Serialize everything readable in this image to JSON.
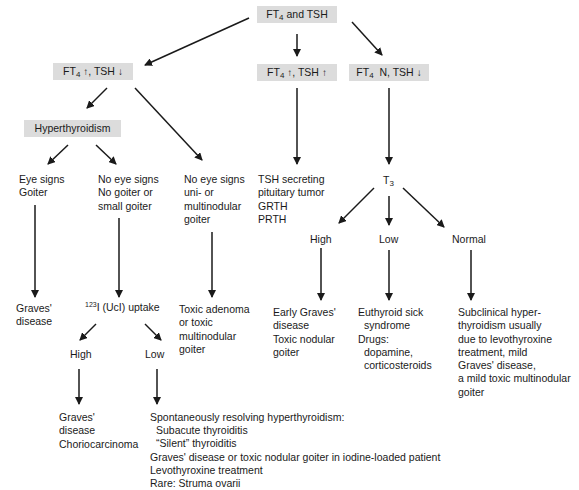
{
  "diagram": {
    "type": "flowchart",
    "nodes": {
      "root": {
        "label_pre": "FT",
        "label_sub": "4",
        "label_post": " and TSH"
      },
      "ft4_up_tsh_down": {
        "label_pre": "FT",
        "label_sub": "4",
        "ft4_arrow": "↑",
        "label_mid": ", TSH ",
        "tsh_arrow": "↓"
      },
      "ft4_up_tsh_up": {
        "label_pre": "FT",
        "label_sub": "4",
        "ft4_arrow": "↑",
        "label_mid": ", TSH  ",
        "tsh_arrow": "↑"
      },
      "ft4_n_tsh_down": {
        "label_pre": "FT",
        "label_sub": "4",
        "label_mid": "  N, TSH ",
        "tsh_arrow": "↓"
      },
      "hyperthyroidism": {
        "label": "Hyperthyroidism"
      },
      "eye_signs": {
        "lines": [
          "Eye signs",
          "Goiter"
        ]
      },
      "no_eye_signs_small": {
        "lines": [
          "No eye signs",
          "No goiter or",
          "small goiter"
        ]
      },
      "no_eye_signs_nodular": {
        "lines": [
          "No eye signs",
          "uni- or",
          "multinodular",
          "goiter"
        ]
      },
      "tsh_secreting": {
        "lines": [
          "TSH secreting",
          "pituitary tumor",
          "GRTH",
          "PRTH"
        ]
      },
      "t3": {
        "label_pre": "T",
        "label_sub": "3"
      },
      "graves_1": {
        "lines": [
          "Graves'",
          "disease"
        ]
      },
      "uptake": {
        "sup": "123",
        "label": "I (UcI) uptake"
      },
      "toxic_adenoma": {
        "lines": [
          "Toxic adenoma",
          "or toxic",
          "multinodular",
          "goiter"
        ]
      },
      "uptake_high": {
        "label": "High"
      },
      "uptake_low": {
        "label": "Low"
      },
      "graves_chorio": {
        "lines": [
          "Graves'",
          "disease",
          "Choriocarcinoma"
        ]
      },
      "low_uptake_causes": {
        "lines": [
          {
            "text": "Spontaneously resolving hyperthyroidism:",
            "indent": false
          },
          {
            "text": "Subacute thyroiditis",
            "indent": true
          },
          {
            "text": "“Silent” thyroiditis",
            "indent": true
          },
          {
            "text": "Graves' disease or toxic nodular goiter in iodine-loaded patient",
            "indent": false
          },
          {
            "text": "Levothyroxine treatment",
            "indent": false
          },
          {
            "text": "Rare: Struma ovarii",
            "indent": false
          }
        ]
      },
      "t3_high": {
        "label": "High"
      },
      "t3_low": {
        "label": "Low"
      },
      "t3_normal": {
        "label": "Normal"
      },
      "early_graves": {
        "lines": [
          "Early Graves'",
          "disease",
          "Toxic nodular",
          "goiter"
        ]
      },
      "euthyroid_sick": {
        "lines": [
          {
            "text": "Euthyroid sick",
            "indent": false
          },
          {
            "text": "syndrome",
            "indent": true
          },
          {
            "text": "Drugs:",
            "indent": false
          },
          {
            "text": "dopamine,",
            "indent": true
          },
          {
            "text": "corticosteroids",
            "indent": true
          }
        ]
      },
      "subclinical": {
        "lines": [
          "Subclinical hyper-",
          "thyroidism usually",
          "due to levothyroxine",
          "treatment, mild",
          "Graves' disease,",
          "a mild toxic multinodular",
          "goiter"
        ]
      }
    },
    "edges": [
      [
        "root",
        "ft4_up_tsh_down"
      ],
      [
        "root",
        "ft4_up_tsh_up"
      ],
      [
        "root",
        "ft4_n_tsh_down"
      ],
      [
        "ft4_up_tsh_down",
        "hyperthyroidism"
      ],
      [
        "ft4_up_tsh_down",
        "no_eye_signs_nodular"
      ],
      [
        "hyperthyroidism",
        "eye_signs"
      ],
      [
        "hyperthyroidism",
        "no_eye_signs_small"
      ],
      [
        "eye_signs",
        "graves_1"
      ],
      [
        "no_eye_signs_small",
        "uptake"
      ],
      [
        "no_eye_signs_nodular",
        "toxic_adenoma"
      ],
      [
        "uptake",
        "uptake_high"
      ],
      [
        "uptake",
        "uptake_low"
      ],
      [
        "uptake_high",
        "graves_chorio"
      ],
      [
        "uptake_low",
        "low_uptake_causes"
      ],
      [
        "ft4_up_tsh_up",
        "tsh_secreting"
      ],
      [
        "ft4_n_tsh_down",
        "t3"
      ],
      [
        "t3",
        "t3_high"
      ],
      [
        "t3",
        "t3_low"
      ],
      [
        "t3",
        "t3_normal"
      ],
      [
        "t3_high",
        "early_graves"
      ],
      [
        "t3_low",
        "euthyroid_sick"
      ],
      [
        "t3_normal",
        "subclinical"
      ]
    ],
    "colors": {
      "box_fill": "#dcdcdc",
      "line": "#1a1a1a",
      "text": "#1a1a1a"
    }
  }
}
